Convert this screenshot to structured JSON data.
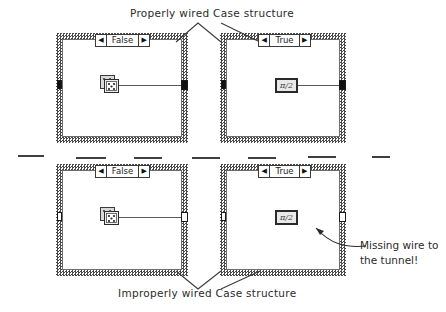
{
  "figure": {
    "title_top": "Properly wired Case structure",
    "title_bottom": "Improperly wired Case structure",
    "annotation": {
      "line1": "Missing wire to",
      "line2": "the tunnel!"
    }
  },
  "colors": {
    "ink": "#2b2b2b",
    "frame_hatch": "#4a4a4a",
    "wire": "#5a5a5a",
    "tunnel_filled": "#101010",
    "tunnel_hollow": "#ffffff",
    "background": "#ffffff"
  },
  "structures": [
    {
      "id": "top-false",
      "group": "properly-wired",
      "selector": {
        "label": "False",
        "left_arrow": "◀",
        "right_arrow": "▶"
      },
      "node": {
        "type": "dice-icon",
        "label": ""
      },
      "input_tunnel": {
        "state": "filled"
      },
      "output_tunnel": {
        "state": "filled"
      },
      "wire": {
        "present": true
      }
    },
    {
      "id": "top-true",
      "group": "properly-wired",
      "selector": {
        "label": "True",
        "left_arrow": "◀",
        "right_arrow": "▶"
      },
      "node": {
        "type": "pi-constant-icon",
        "label": "π/2"
      },
      "input_tunnel": {
        "state": "filled"
      },
      "output_tunnel": {
        "state": "filled"
      },
      "wire": {
        "present": true
      }
    },
    {
      "id": "bottom-false",
      "group": "improperly-wired",
      "selector": {
        "label": "False",
        "left_arrow": "◀",
        "right_arrow": "▶"
      },
      "node": {
        "type": "dice-icon",
        "label": ""
      },
      "input_tunnel": {
        "state": "hollow"
      },
      "output_tunnel": {
        "state": "hollow"
      },
      "wire": {
        "present": true
      }
    },
    {
      "id": "bottom-true",
      "group": "improperly-wired",
      "selector": {
        "label": "True",
        "left_arrow": "◀",
        "right_arrow": "▶"
      },
      "node": {
        "type": "pi-constant-icon",
        "label": "π/2"
      },
      "input_tunnel": {
        "state": "hollow"
      },
      "output_tunnel": {
        "state": "hollow"
      },
      "wire": {
        "present": false
      }
    }
  ]
}
